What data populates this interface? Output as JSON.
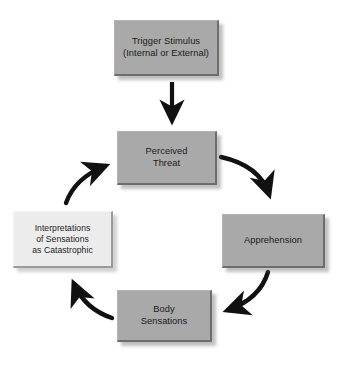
{
  "diagram": {
    "type": "cycle-flowchart",
    "background_color": "#ffffff",
    "box_fill_color": "#a9a9a9",
    "highlight_box_fill_color": "#ececec",
    "arrow_color": "#111111",
    "text_color": "#1b1b1b",
    "nodes": [
      {
        "id": "trigger",
        "label": "Trigger Stimulus\n(Internal or External)",
        "style": "gray"
      },
      {
        "id": "perceived",
        "label": "Perceived\nThreat",
        "style": "gray"
      },
      {
        "id": "apprehension",
        "label": "Apprehension",
        "style": "gray"
      },
      {
        "id": "body",
        "label": "Body\nSensations",
        "style": "gray"
      },
      {
        "id": "interpretations",
        "label": "Interpretations\nof Sensations\nas Catastrophic",
        "style": "light"
      }
    ],
    "edges": [
      {
        "id": "trigger-to-perceived",
        "from": "trigger",
        "to": "perceived",
        "shape": "straight-down"
      },
      {
        "id": "perceived-to-apprehension",
        "from": "perceived",
        "to": "apprehension",
        "shape": "curve-clockwise"
      },
      {
        "id": "apprehension-to-body",
        "from": "apprehension",
        "to": "body",
        "shape": "curve-clockwise"
      },
      {
        "id": "body-to-interpretations",
        "from": "body",
        "to": "interpretations",
        "shape": "curve-clockwise"
      },
      {
        "id": "interpretations-to-perceived",
        "from": "interpretations",
        "to": "perceived",
        "shape": "curve-clockwise"
      }
    ]
  }
}
